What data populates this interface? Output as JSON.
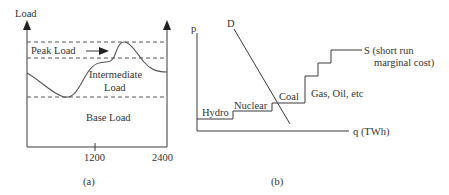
{
  "panel_a": {
    "y_label": "Load",
    "x_ticks": [
      "1200",
      "2400"
    ],
    "regions": {
      "peak": "Peak Load",
      "intermediate_line1": "Intermediate",
      "intermediate_line2": "Load",
      "base": "Base Load"
    },
    "caption": "(a)"
  },
  "panel_b": {
    "y_label": "p",
    "x_label": "q (TWh)",
    "demand_label": "D",
    "supply_label_line1": "S (short run",
    "supply_label_line2": "marginal cost)",
    "steps": [
      "Hydro",
      "Nuclear",
      "Coal",
      "Gas, Oil, etc"
    ],
    "caption": "(b)"
  },
  "colors": {
    "line": "#3a3a3a",
    "text": "#333333",
    "background": "#ffffff"
  }
}
